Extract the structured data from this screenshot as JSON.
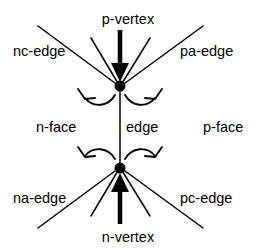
{
  "figure": {
    "type": "diagram",
    "background_color": "#ffffff",
    "stroke_color": "#000000"
  },
  "labels": {
    "p_vertex": "p-vertex",
    "n_vertex": "n-vertex",
    "nc_edge": "nc-edge",
    "pa_edge": "pa-edge",
    "na_edge": "na-edge",
    "pc_edge": "pc-edge",
    "n_face": "n-face",
    "p_face": "p-face",
    "edge": "edge"
  },
  "nodes": [
    {
      "name": "p-vertex-node",
      "x": 120,
      "y": 86,
      "radius": 5.5
    },
    {
      "name": "n-vertex-node",
      "x": 120,
      "y": 168,
      "radius": 5.5
    }
  ],
  "edges": [
    {
      "name": "edge",
      "x1": 120,
      "y1": 86,
      "x2": 120,
      "y2": 168
    },
    {
      "name": "nc-edge",
      "x1": 38,
      "y1": 26,
      "x2": 120,
      "y2": 86
    },
    {
      "name": "pa-edge",
      "x1": 203,
      "y1": 26,
      "x2": 120,
      "y2": 86
    },
    {
      "name": "na-edge",
      "x1": 38,
      "y1": 228,
      "x2": 120,
      "y2": 168
    },
    {
      "name": "pc-edge",
      "x1": 203,
      "y1": 228,
      "x2": 120,
      "y2": 168
    },
    {
      "name": "p-inner-left",
      "x1": 91,
      "y1": 38,
      "x2": 120,
      "y2": 86
    },
    {
      "name": "p-inner-right",
      "x1": 150,
      "y1": 38,
      "x2": 120,
      "y2": 86
    },
    {
      "name": "n-inner-left",
      "x1": 91,
      "y1": 216,
      "x2": 120,
      "y2": 168
    },
    {
      "name": "n-inner-right",
      "x1": 150,
      "y1": 216,
      "x2": 120,
      "y2": 168
    }
  ],
  "arrows": [
    {
      "name": "p-vertex-arrow",
      "direction": "down",
      "x": 120,
      "y_start": 30,
      "y_end": 82
    },
    {
      "name": "n-vertex-arrow",
      "direction": "up",
      "x": 120,
      "y_start": 224,
      "y_end": 173
    }
  ],
  "arcs": [
    {
      "name": "p-vertex-left-arc",
      "points_to": "up-left"
    },
    {
      "name": "p-vertex-right-arc",
      "points_to": "up-right"
    },
    {
      "name": "n-vertex-left-arc",
      "points_to": "up-left"
    },
    {
      "name": "n-vertex-right-arc",
      "points_to": "up-right"
    }
  ]
}
